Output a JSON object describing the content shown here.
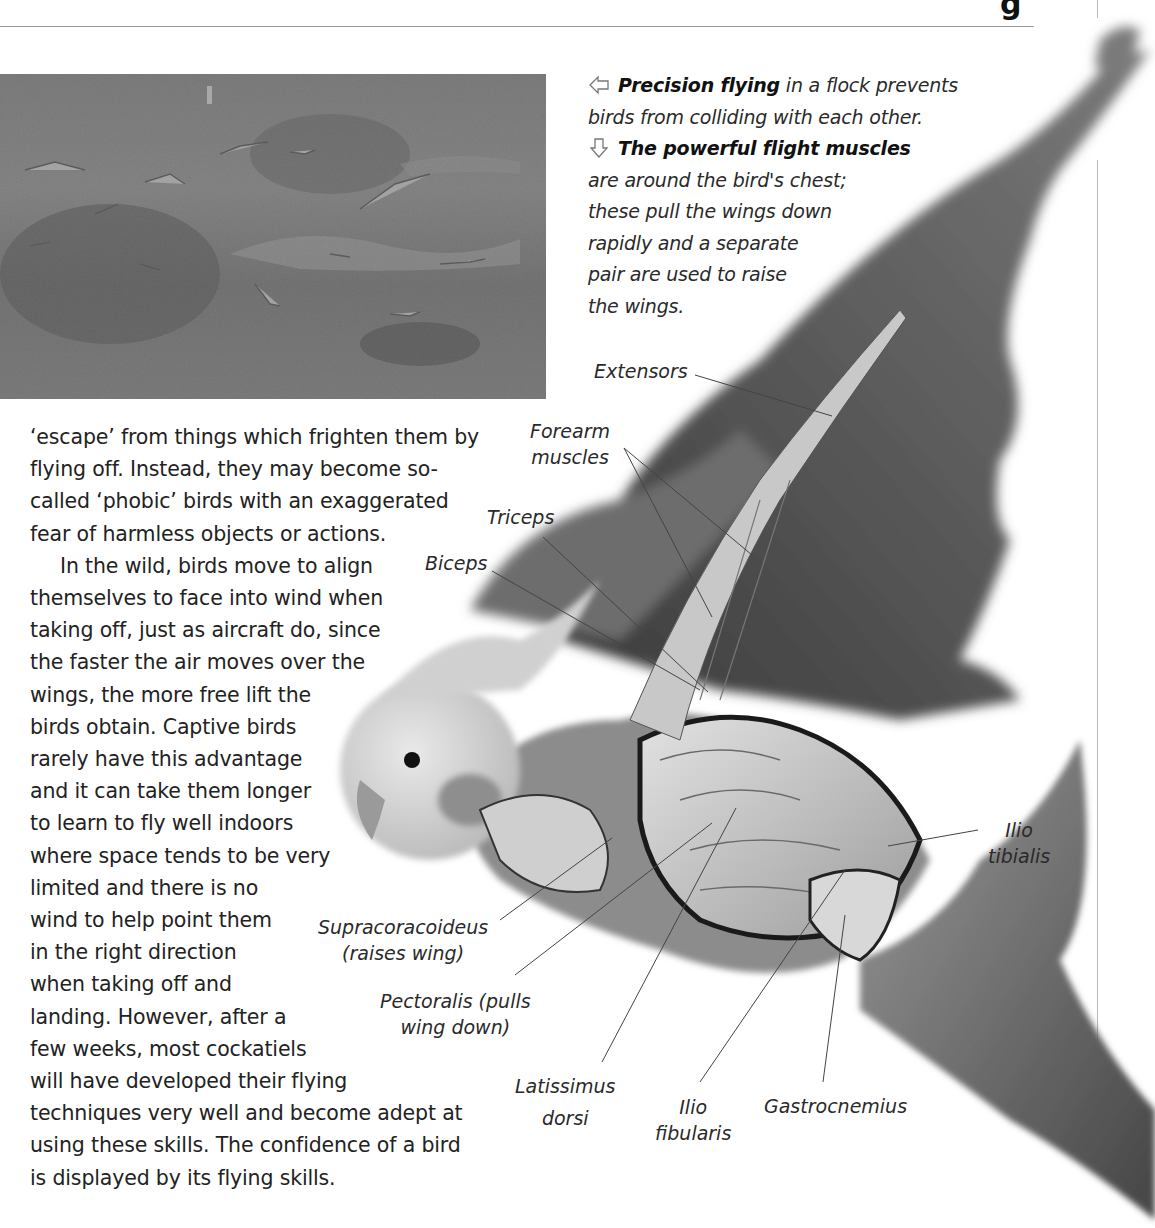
{
  "page": {
    "header_rule": true,
    "corner_mark": "g"
  },
  "photo": {
    "alt": "Flock of cockatiels flying low over grass and scrub",
    "tone": "grayscale"
  },
  "caption": {
    "items": [
      {
        "icon": "arrow-left-outline-icon",
        "bold": "Precision flying",
        "lines": [
          " in a flock prevents",
          "birds from colliding with each other."
        ]
      },
      {
        "icon": "arrow-down-outline-icon",
        "bold": "The powerful flight muscles",
        "lines": [
          "are around the bird's chest;",
          "these pull the wings down",
          "rapidly and a separate",
          "pair are used to raise",
          "the wings."
        ]
      }
    ]
  },
  "body_text": {
    "lines": [
      "‘escape’ from things which frighten them by",
      "flying off. Instead, they may become so-",
      "called ‘phobic’ birds with an exaggerated",
      "fear of harmless objects or actions.",
      "In the wild, birds move to align",
      "themselves to face into wind when",
      "taking off, just as aircraft do, since",
      "the faster the air moves over the",
      "wings, the more free lift the",
      "birds obtain. Captive birds",
      "rarely have this advantage",
      "and it can take them longer",
      "to learn to fly well indoors",
      "where space tends to be very",
      "limited and there is no",
      "wind to help point them",
      "in the right direction",
      "when taking off and",
      "landing. However, after a",
      "few weeks, most cockatiels",
      "will have developed their flying",
      "techniques very well and become adept at",
      "using these skills. The confidence of a bird",
      "is displayed by its flying skills."
    ],
    "indent_line_index": 4
  },
  "diagram": {
    "labels": {
      "extensors": [
        "Extensors"
      ],
      "forearm": [
        "Forearm",
        "muscles"
      ],
      "triceps": [
        "Triceps"
      ],
      "biceps": [
        "Biceps"
      ],
      "supracoracoideus": [
        "Supracoracoideus",
        "(raises wing)"
      ],
      "pectoralis": [
        "Pectoralis (pulls",
        "wing down)"
      ],
      "latissimus": [
        "Latissimus",
        "dorsi"
      ],
      "ilio_fibularis": [
        "Ilio",
        "fibularis"
      ],
      "gastrocnemius": [
        "Gastrocnemius"
      ],
      "ilio_tibialis": [
        "Ilio",
        "tibialis"
      ]
    }
  }
}
